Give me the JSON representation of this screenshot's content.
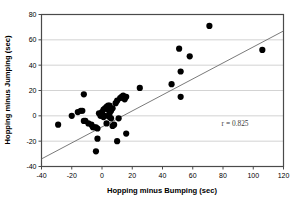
{
  "chart_data": {
    "type": "scatter",
    "title": "",
    "xlabel": "Hopping minus Bumping (sec)",
    "ylabel": "Hopping minus Jumping (sec)",
    "xlim": [
      -40,
      120
    ],
    "ylim": [
      -40,
      80
    ],
    "xticks": [
      -40,
      -20,
      0,
      20,
      40,
      60,
      80,
      100,
      120
    ],
    "yticks": [
      -40,
      -20,
      0,
      20,
      40,
      60,
      80
    ],
    "xtick_labels": [
      "-40",
      "-20",
      "0",
      "20",
      "40",
      "60",
      "80",
      "100",
      "120"
    ],
    "ytick_labels": [
      "-40",
      "-20",
      "0",
      "20",
      "40",
      "60",
      "80"
    ],
    "grid": "horizontal",
    "grid_color": "#c8c8c8",
    "axis_color": "#4a4a4a",
    "marker_color": "#000000",
    "marker_shape": "circle",
    "marker_size": 3.1,
    "legend": "none",
    "annotations": [
      {
        "text": "r = 0.825",
        "x": 88,
        "y": -8,
        "name": "correlation-annotation"
      }
    ],
    "trendline": {
      "name": "regression-line",
      "color": "#6b6b6b",
      "width": 0.9,
      "x": [
        -40,
        120
      ],
      "y": [
        -34,
        67
      ]
    },
    "points": [
      {
        "x": -29,
        "y": -7
      },
      {
        "x": -20,
        "y": 0
      },
      {
        "x": -16,
        "y": 3
      },
      {
        "x": -14,
        "y": 4
      },
      {
        "x": -13,
        "y": 4
      },
      {
        "x": -12,
        "y": 17
      },
      {
        "x": -12,
        "y": -4
      },
      {
        "x": -11,
        "y": -4
      },
      {
        "x": -9,
        "y": -6
      },
      {
        "x": -7,
        "y": -7
      },
      {
        "x": -6,
        "y": -9
      },
      {
        "x": -5,
        "y": -9
      },
      {
        "x": -4,
        "y": -9
      },
      {
        "x": -4,
        "y": -28
      },
      {
        "x": -3,
        "y": -10
      },
      {
        "x": -3,
        "y": -18
      },
      {
        "x": -2,
        "y": 2
      },
      {
        "x": -1,
        "y": 0
      },
      {
        "x": 0,
        "y": 1
      },
      {
        "x": 0,
        "y": 3
      },
      {
        "x": 1,
        "y": 5
      },
      {
        "x": 1,
        "y": -1
      },
      {
        "x": 2,
        "y": 6
      },
      {
        "x": 2,
        "y": 0
      },
      {
        "x": 3,
        "y": 7
      },
      {
        "x": 3,
        "y": -6
      },
      {
        "x": 4,
        "y": 8
      },
      {
        "x": 4,
        "y": 5
      },
      {
        "x": 5,
        "y": 8
      },
      {
        "x": 5,
        "y": 2
      },
      {
        "x": 5,
        "y": -1
      },
      {
        "x": 6,
        "y": 4
      },
      {
        "x": 6,
        "y": -2
      },
      {
        "x": 7,
        "y": 6
      },
      {
        "x": 7,
        "y": -8
      },
      {
        "x": 8,
        "y": -7
      },
      {
        "x": 9,
        "y": 10
      },
      {
        "x": 10,
        "y": 12
      },
      {
        "x": 10,
        "y": -20
      },
      {
        "x": 11,
        "y": -2
      },
      {
        "x": 12,
        "y": 14
      },
      {
        "x": 13,
        "y": 15
      },
      {
        "x": 14,
        "y": 16
      },
      {
        "x": 15,
        "y": 13
      },
      {
        "x": 16,
        "y": 15
      },
      {
        "x": 16,
        "y": -14
      },
      {
        "x": 25,
        "y": 22
      },
      {
        "x": 46,
        "y": 25
      },
      {
        "x": 51,
        "y": 53
      },
      {
        "x": 52,
        "y": 35
      },
      {
        "x": 52,
        "y": 15
      },
      {
        "x": 58,
        "y": 47
      },
      {
        "x": 71,
        "y": 71
      },
      {
        "x": 106,
        "y": 52
      }
    ]
  }
}
